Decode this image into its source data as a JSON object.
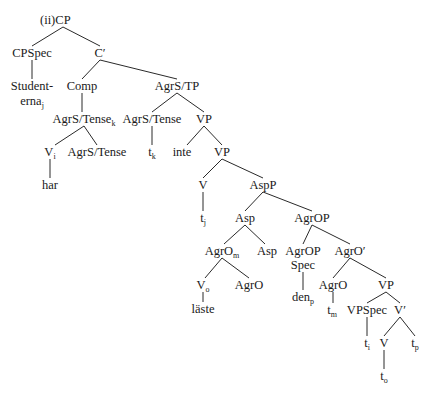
{
  "example_label": "(ii)",
  "line_color": "#2a2a2a",
  "nodes": [
    {
      "id": "cp",
      "label": "CP",
      "sub": "",
      "x": 63,
      "y": 20
    },
    {
      "id": "cpspec",
      "label": "CPSpec",
      "sub": "",
      "x": 32,
      "y": 53
    },
    {
      "id": "cbar",
      "label": "C′",
      "sub": "",
      "x": 100,
      "y": 53
    },
    {
      "id": "studenterna1",
      "label": "Student-",
      "sub": "",
      "x": 32,
      "y": 86
    },
    {
      "id": "studenterna2",
      "label": "erna",
      "sub": "j",
      "x": 32,
      "y": 101
    },
    {
      "id": "comp",
      "label": "Comp",
      "sub": "",
      "x": 82,
      "y": 86
    },
    {
      "id": "agrstp",
      "label": "AgrS/TP",
      "sub": "",
      "x": 177,
      "y": 86
    },
    {
      "id": "agrstense_k",
      "label": "AgrS/Tense",
      "sub": "k",
      "x": 84,
      "y": 119
    },
    {
      "id": "agrstense_2",
      "label": "AgrS/Tense",
      "sub": "",
      "x": 152,
      "y": 119
    },
    {
      "id": "vp1",
      "label": "VP",
      "sub": "",
      "x": 204,
      "y": 119
    },
    {
      "id": "v_i",
      "label": "V",
      "sub": "i",
      "x": 50,
      "y": 152
    },
    {
      "id": "agrstense_3",
      "label": "AgrS/Tense",
      "sub": "",
      "x": 97,
      "y": 152
    },
    {
      "id": "t_k",
      "label": "t",
      "sub": "k",
      "x": 152,
      "y": 152
    },
    {
      "id": "inte",
      "label": "inte",
      "sub": "",
      "x": 182,
      "y": 152
    },
    {
      "id": "vp2",
      "label": "VP",
      "sub": "",
      "x": 222,
      "y": 152
    },
    {
      "id": "har",
      "label": "har",
      "sub": "",
      "x": 50,
      "y": 185
    },
    {
      "id": "v_1",
      "label": "V",
      "sub": "",
      "x": 203,
      "y": 185
    },
    {
      "id": "aspp",
      "label": "AspP",
      "sub": "",
      "x": 263,
      "y": 185
    },
    {
      "id": "t_j",
      "label": "t",
      "sub": "j",
      "x": 203,
      "y": 218
    },
    {
      "id": "asp_1",
      "label": "Asp",
      "sub": "",
      "x": 245,
      "y": 218
    },
    {
      "id": "agrop",
      "label": "AgrOP",
      "sub": "",
      "x": 312,
      "y": 218
    },
    {
      "id": "agro_m",
      "label": "AgrO",
      "sub": "m",
      "x": 222,
      "y": 251
    },
    {
      "id": "asp_2",
      "label": "Asp",
      "sub": "",
      "x": 267,
      "y": 251
    },
    {
      "id": "agropspec1",
      "label": "AgrOP",
      "sub": "",
      "x": 303,
      "y": 251
    },
    {
      "id": "agropspec2",
      "label": "Spec",
      "sub": "",
      "x": 303,
      "y": 265
    },
    {
      "id": "agrobar",
      "label": "AgrO′",
      "sub": "",
      "x": 350,
      "y": 251
    },
    {
      "id": "v_o",
      "label": "V",
      "sub": "o",
      "x": 203,
      "y": 285
    },
    {
      "id": "agro_1",
      "label": "AgrO",
      "sub": "",
      "x": 249,
      "y": 285
    },
    {
      "id": "agro_2",
      "label": "AgrO",
      "sub": "",
      "x": 333,
      "y": 285
    },
    {
      "id": "vp3",
      "label": "VP",
      "sub": "",
      "x": 386,
      "y": 285
    },
    {
      "id": "laste",
      "label": "läste",
      "sub": "",
      "x": 203,
      "y": 309
    },
    {
      "id": "den_p",
      "label": "den",
      "sub": "p",
      "x": 303,
      "y": 297
    },
    {
      "id": "t_m",
      "label": "t",
      "sub": "m",
      "x": 332,
      "y": 310
    },
    {
      "id": "vpspec",
      "label": "VPSpec",
      "sub": "",
      "x": 367,
      "y": 310
    },
    {
      "id": "vbar",
      "label": "V′",
      "sub": "",
      "x": 400,
      "y": 310
    },
    {
      "id": "t_i",
      "label": "t",
      "sub": "i",
      "x": 367,
      "y": 343
    },
    {
      "id": "v_2",
      "label": "V",
      "sub": "",
      "x": 384,
      "y": 343
    },
    {
      "id": "t_p",
      "label": "t",
      "sub": "p",
      "x": 415,
      "y": 343
    },
    {
      "id": "t_o",
      "label": "t",
      "sub": "o",
      "x": 384,
      "y": 376
    }
  ],
  "edges": [
    [
      63,
      27,
      32,
      46
    ],
    [
      63,
      27,
      100,
      46
    ],
    [
      32,
      60,
      32,
      79
    ],
    [
      100,
      60,
      82,
      79
    ],
    [
      100,
      60,
      177,
      79
    ],
    [
      82,
      93,
      82,
      112
    ],
    [
      177,
      93,
      152,
      112
    ],
    [
      177,
      93,
      204,
      112
    ],
    [
      84,
      126,
      55,
      145
    ],
    [
      84,
      126,
      97,
      145
    ],
    [
      152,
      126,
      152,
      145
    ],
    [
      204,
      126,
      187,
      145
    ],
    [
      204,
      126,
      222,
      145
    ],
    [
      50,
      159,
      50,
      178
    ],
    [
      222,
      159,
      203,
      178
    ],
    [
      222,
      159,
      263,
      178
    ],
    [
      203,
      192,
      203,
      211
    ],
    [
      263,
      192,
      245,
      211
    ],
    [
      263,
      192,
      312,
      211
    ],
    [
      245,
      225,
      224,
      244
    ],
    [
      245,
      225,
      265,
      244
    ],
    [
      312,
      225,
      303,
      244
    ],
    [
      312,
      225,
      350,
      244
    ],
    [
      222,
      258,
      205,
      278
    ],
    [
      222,
      258,
      249,
      278
    ],
    [
      303,
      272,
      303,
      290
    ],
    [
      350,
      258,
      333,
      278
    ],
    [
      350,
      258,
      386,
      278
    ],
    [
      203,
      292,
      203,
      302
    ],
    [
      333,
      292,
      333,
      303
    ],
    [
      386,
      292,
      367,
      303
    ],
    [
      386,
      292,
      400,
      303
    ],
    [
      367,
      317,
      367,
      336
    ],
    [
      400,
      317,
      384,
      336
    ],
    [
      400,
      317,
      415,
      336
    ],
    [
      384,
      350,
      384,
      369
    ]
  ]
}
